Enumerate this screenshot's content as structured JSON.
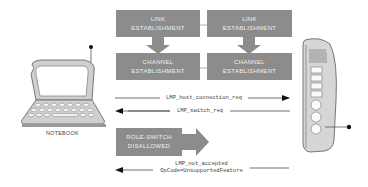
{
  "diagram": {
    "devices": {
      "left": {
        "label": "NOTEBOOK",
        "icon": "notebook-icon"
      },
      "right": {
        "label": "",
        "icon": "phone-handset-icon"
      }
    },
    "boxes": {
      "left_link": {
        "line1": "Link",
        "line2": "Establishment"
      },
      "left_channel": {
        "line1": "Channel",
        "line2": "Establishment"
      },
      "right_link": {
        "line1": "Link",
        "line2": "Establishment"
      },
      "right_channel": {
        "line1": "Channel",
        "line2": "Establishment"
      },
      "role_switch": {
        "line1": "Role-Switch",
        "line2": "Disallowed"
      }
    },
    "messages": [
      {
        "text": "LMP_host_connection_req",
        "direction": "right"
      },
      {
        "text": "LMP_switch_req",
        "direction": "left"
      },
      {
        "line1": "LMP_not_accepted",
        "line2": "OpCode=UnsupportedFeature",
        "direction": "left"
      }
    ],
    "colors": {
      "box_fill": "#8c8c8c",
      "box_text": "#f0f0f0",
      "device_fill": "#d4d4d4",
      "line": "#333333"
    }
  }
}
